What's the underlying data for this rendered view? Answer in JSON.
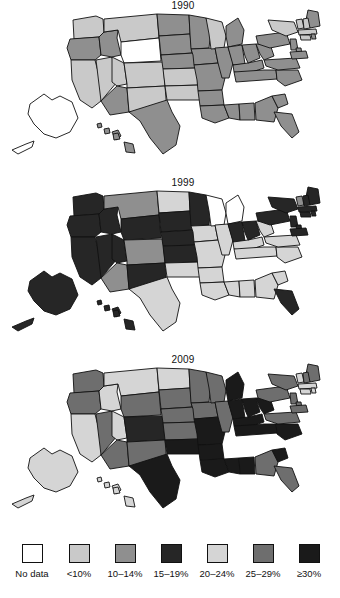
{
  "figure": {
    "type": "choropleth-map-series",
    "panels": [
      {
        "title": "1990"
      },
      {
        "title": "1999"
      },
      {
        "title": "2009"
      }
    ]
  },
  "legend": {
    "items": [
      {
        "label": "No data",
        "color": "#ffffff"
      },
      {
        "label": "<10%",
        "color": "#c9c9c9"
      },
      {
        "label": "10–14%",
        "color": "#8f8f8f"
      },
      {
        "label": "15–19%",
        "color": "#262626"
      },
      {
        "label": "20–24%",
        "color": "#d5d5d5"
      },
      {
        "label": "25–29%",
        "color": "#6e6e6e"
      },
      {
        "label": "≥30%",
        "color": "#1a1a1a"
      }
    ]
  },
  "chart_data": {
    "type": "heatmap",
    "xlabel": "",
    "ylabel": "",
    "legend_position": "bottom",
    "grid": false,
    "categories": [
      "No data",
      "<10%",
      "10–14%",
      "15–19%",
      "20–24%",
      "25–29%",
      "≥30%"
    ],
    "category_colors": [
      "#ffffff",
      "#c9c9c9",
      "#8f8f8f",
      "#262626",
      "#d5d5d5",
      "#6e6e6e",
      "#1a1a1a"
    ],
    "series": [
      {
        "name": "1990",
        "values": {
          "AL": "10–14%",
          "AK": "No data",
          "AZ": "10–14%",
          "AR": "10–14%",
          "CA": "<10%",
          "CO": "<10%",
          "CT": "<10%",
          "DE": "10–14%",
          "FL": "10–14%",
          "GA": "10–14%",
          "HI": "10–14%",
          "ID": "10–14%",
          "IL": "10–14%",
          "IN": "10–14%",
          "IA": "10–14%",
          "KS": "<10%",
          "KY": "10–14%",
          "LA": "10–14%",
          "ME": "10–14%",
          "MD": "10–14%",
          "MA": "<10%",
          "MI": "10–14%",
          "MN": "10–14%",
          "MS": "10–14%",
          "MO": "10–14%",
          "MT": "<10%",
          "NE": "10–14%",
          "NV": "<10%",
          "NH": "<10%",
          "NJ": "10–14%",
          "NM": "<10%",
          "NY": "<10%",
          "NC": "10–14%",
          "ND": "10–14%",
          "OH": "10–14%",
          "OK": "<10%",
          "OR": "10–14%",
          "PA": "10–14%",
          "RI": "10–14%",
          "SC": "10–14%",
          "SD": "10–14%",
          "TN": "10–14%",
          "TX": "10–14%",
          "UT": "<10%",
          "VT": "<10%",
          "VA": "10–14%",
          "WA": "<10%",
          "WV": "10–14%",
          "WI": "<10%",
          "WY": "No data"
        }
      },
      {
        "name": "1999",
        "values": {
          "AL": "20–24%",
          "AK": "15–19%",
          "AZ": "10–14%",
          "AR": "20–24%",
          "CA": "15–19%",
          "CO": "10–14%",
          "CT": "15–19%",
          "DE": "15–19%",
          "FL": "15–19%",
          "GA": "20–24%",
          "HI": "15–19%",
          "ID": "15–19%",
          "IL": "20–24%",
          "IN": "15–19%",
          "IA": "20–24%",
          "KS": "15–19%",
          "KY": "20–24%",
          "LA": "20–24%",
          "ME": "15–19%",
          "MD": "15–19%",
          "MA": "15–19%",
          "MI": "No data",
          "MN": "15–19%",
          "MS": "20–24%",
          "MO": "20–24%",
          "MT": "10–14%",
          "NE": "15–19%",
          "NV": "15–19%",
          "NH": "15–19%",
          "NJ": "15–19%",
          "NM": "15–19%",
          "NY": "15–19%",
          "NC": "20–24%",
          "ND": "20–24%",
          "OH": "15–19%",
          "OK": "20–24%",
          "OR": "15–19%",
          "PA": "15–19%",
          "RI": "15–19%",
          "SC": "20–24%",
          "SD": "15–19%",
          "TN": "20–24%",
          "TX": "20–24%",
          "UT": "15–19%",
          "VT": "10–14%",
          "VA": "20–24%",
          "WA": "15–19%",
          "WV": "20–24%",
          "WI": "No data",
          "WY": "15–19%"
        }
      },
      {
        "name": "2009",
        "values": {
          "AL": "≥30%",
          "AK": "20–24%",
          "AZ": "25–29%",
          "AR": "≥30%",
          "CA": "20–24%",
          "CO": "15–19%",
          "CT": "20–24%",
          "DE": "25–29%",
          "FL": "25–29%",
          "GA": "25–29%",
          "HI": "20–24%",
          "ID": "20–24%",
          "IL": "25–29%",
          "IN": "≥30%",
          "IA": "25–29%",
          "KS": "25–29%",
          "KY": "≥30%",
          "LA": "≥30%",
          "ME": "25–29%",
          "MD": "25–29%",
          "MA": "20–24%",
          "MI": "≥30%",
          "MN": "25–29%",
          "MS": "≥30%",
          "MO": "≥30%",
          "MT": "20–24%",
          "NE": "25–29%",
          "NV": "25–29%",
          "NH": "25–29%",
          "NJ": "25–29%",
          "NM": "25–29%",
          "NY": "25–29%",
          "NC": "≥30%",
          "ND": "20–24%",
          "OH": "≥30%",
          "OK": "≥30%",
          "OR": "25–29%",
          "PA": "25–29%",
          "RI": "20–24%",
          "SC": "≥30%",
          "SD": "25–29%",
          "TN": "≥30%",
          "TX": "≥30%",
          "UT": "20–24%",
          "VT": "20–24%",
          "VA": "25–29%",
          "WA": "25–29%",
          "WV": "≥30%",
          "WI": "25–29%",
          "WY": "25–29%"
        }
      }
    ]
  }
}
